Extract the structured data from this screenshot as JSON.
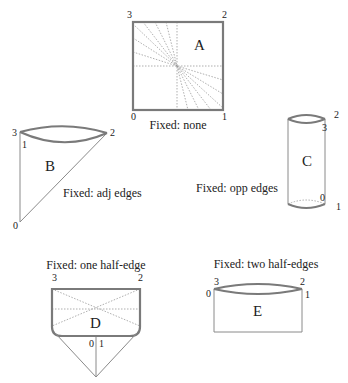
{
  "panels": {
    "A": {
      "letter": "A",
      "caption": "Fixed: none",
      "vertices": [
        "0",
        "1",
        "2",
        "3"
      ]
    },
    "B": {
      "letter": "B",
      "caption": "Fixed: adj edges",
      "vertices": [
        "0",
        "1",
        "2",
        "3"
      ]
    },
    "C": {
      "letter": "C",
      "caption": "Fixed: opp edges",
      "vertices": [
        "0",
        "1",
        "2",
        "3"
      ]
    },
    "D": {
      "letter": "D",
      "caption": "Fixed: one half-edge",
      "vertices": [
        "0",
        "1",
        "2",
        "3"
      ]
    },
    "E": {
      "letter": "E",
      "caption": "Fixed: two half-edges",
      "vertices": [
        "0",
        "1",
        "2",
        "3"
      ]
    }
  },
  "colors": {
    "edge": "#7a7a7a",
    "text": "#222222"
  }
}
